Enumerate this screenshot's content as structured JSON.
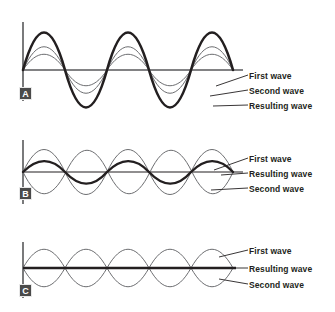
{
  "figure": {
    "background": "#ffffff",
    "ink": "#231f20",
    "thin_stroke": "#58595b",
    "thick_stroke": "#231f20"
  },
  "panels": [
    {
      "id": "A",
      "badge": "A",
      "interference": "constructive",
      "labels": [
        {
          "text": "First wave"
        },
        {
          "text": "Second wave"
        },
        {
          "text": "Resulting wave"
        }
      ]
    },
    {
      "id": "B",
      "badge": "B",
      "interference": "partial",
      "labels": [
        {
          "text": "First wave"
        },
        {
          "text": "Resulting wave"
        },
        {
          "text": "Second wave"
        }
      ]
    },
    {
      "id": "C",
      "badge": "C",
      "interference": "destructive",
      "labels": [
        {
          "text": "First wave"
        },
        {
          "text": "Resulting wave"
        },
        {
          "text": "Second wave"
        }
      ]
    }
  ]
}
